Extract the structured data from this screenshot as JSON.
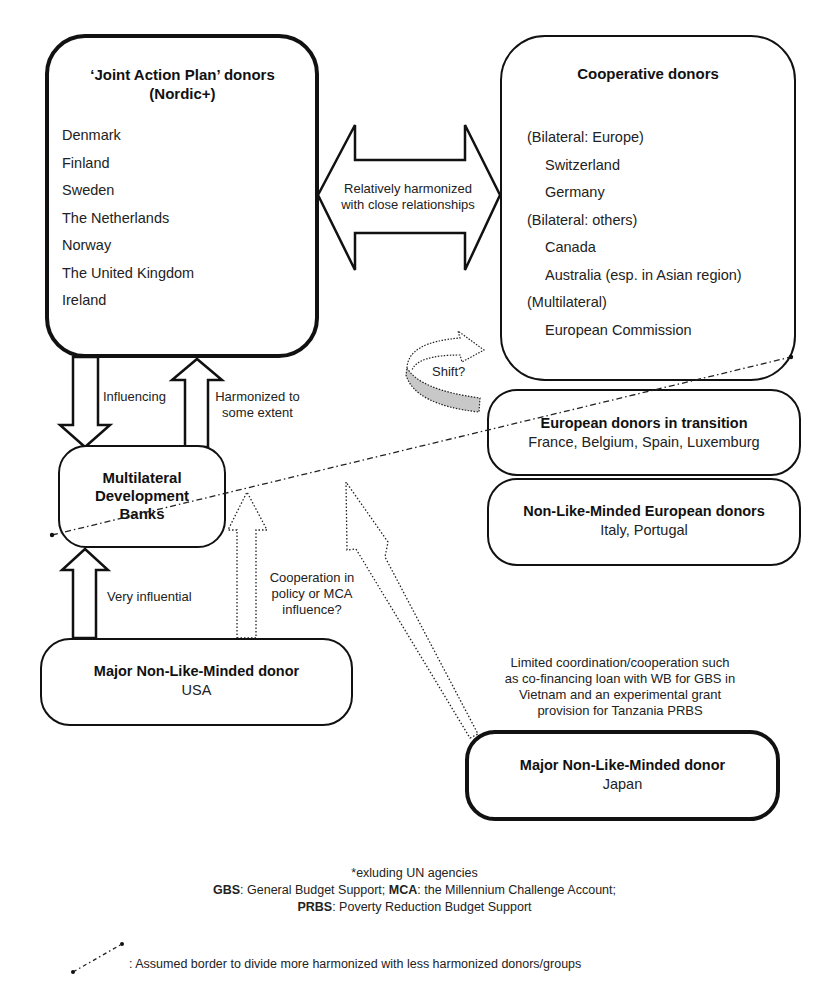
{
  "nordic": {
    "title_line1": "‘Joint Action Plan’ donors",
    "title_line2": "(Nordic+)",
    "members": [
      "Denmark",
      "Finland",
      "Sweden",
      "The Netherlands",
      "Norway",
      "The United Kingdom",
      "Ireland"
    ]
  },
  "cooperative": {
    "title": "Cooperative donors",
    "groups": [
      {
        "heading": "(Bilateral: Europe)",
        "members": [
          "Switzerland",
          "Germany"
        ]
      },
      {
        "heading": "(Bilateral: others)",
        "members": [
          "Canada",
          "Australia (esp. in Asian region)"
        ]
      },
      {
        "heading": "(Multilateral)",
        "members": [
          "European Commission"
        ]
      }
    ]
  },
  "double_arrow_label": {
    "line1": "Relatively harmonized",
    "line2": "with close relationships"
  },
  "shift_label": "Shift?",
  "transition": {
    "title": "European donors in transition",
    "members": "France, Belgium, Spain, Luxemburg"
  },
  "non_like_minded_european": {
    "title": "Non-Like-Minded European donors",
    "members": "Italy, Portugal"
  },
  "mdb": {
    "line1": "Multilateral",
    "line2": "Development",
    "line3": "Banks"
  },
  "arrows": {
    "influencing": "Influencing",
    "harmonized_line1": "Harmonized to",
    "harmonized_line2": "some extent",
    "very_influential": "Very influential",
    "cooperation_line1": "Cooperation in",
    "cooperation_line2": "policy or MCA",
    "cooperation_line3": "influence?"
  },
  "usa": {
    "title": "Major Non-Like-Minded donor",
    "member": "USA"
  },
  "japan_note": {
    "line1": "Limited coordination/cooperation such",
    "line2": "as co-financing loan with WB for GBS in",
    "line3": "Vietnam and an experimental grant",
    "line4": "provision for Tanzania PRBS"
  },
  "japan": {
    "title": "Major Non-Like-Minded donor",
    "member": "Japan"
  },
  "footnotes": {
    "line1": "*exluding UN agencies",
    "gbs_abbr": "GBS",
    "gbs_text": ": General Budget Support; ",
    "mca_abbr": "MCA",
    "mca_text": ": the Millennium Challenge Account;",
    "prbs_abbr": "PRBS",
    "prbs_text": ": Poverty Reduction Budget Support"
  },
  "legend": {
    "border_text": ": Assumed border to divide more harmonized with less harmonized donors/groups"
  },
  "colors": {
    "stroke": "#111111",
    "shift_fill": "#c8c8c8",
    "text": "#222222"
  }
}
